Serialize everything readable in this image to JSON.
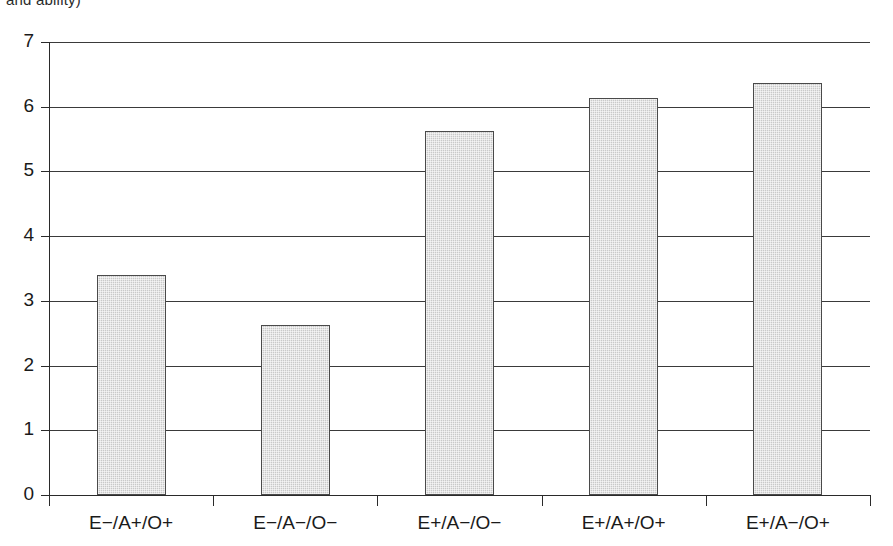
{
  "caption_fragment": "and ability)",
  "chart_data": {
    "type": "bar",
    "title": "",
    "subtitle": "",
    "xlabel": "",
    "ylabel": "",
    "ylim": [
      0,
      7
    ],
    "ytick_values": [
      0,
      1,
      2,
      3,
      4,
      5,
      6,
      7
    ],
    "ytick_labels": [
      "0",
      "1",
      "2",
      "3",
      "4",
      "5",
      "6",
      "7"
    ],
    "grid": "horizontal",
    "legend": "none",
    "bar_fill_color": "#c9c9c9",
    "bar_border_color": "#4a4a4a",
    "axis_color": "#2a2a2a",
    "categories": [
      "E−/A+/O+",
      "E−/A−/O−",
      "E+/A−/O−",
      "E+/A+/O+",
      "E+/A−/O+"
    ],
    "values": [
      3.4,
      2.62,
      5.62,
      6.14,
      6.36
    ]
  }
}
